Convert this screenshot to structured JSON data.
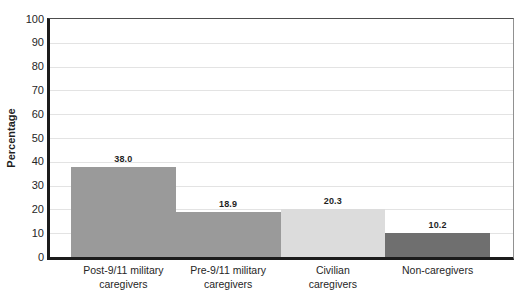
{
  "chart_data": {
    "type": "bar",
    "title": "",
    "xlabel": "",
    "ylabel": "Percentage",
    "categories": [
      "Post-9/11 military\ncaregivers",
      "Pre-9/11 military\ncaregivers",
      "Civilian\ncaregivers",
      "Non-caregivers"
    ],
    "values": [
      38.0,
      18.9,
      20.3,
      10.2
    ],
    "value_labels": [
      "38.0",
      "18.9",
      "20.3",
      "10.2"
    ],
    "ylim": [
      0,
      100
    ],
    "yticks": [
      0,
      10,
      20,
      30,
      40,
      50,
      60,
      70,
      80,
      90,
      100
    ],
    "grid": true,
    "legend": "none",
    "bar_colors": [
      "#9a9a9a",
      "#9a9a9a",
      "#dcdcdc",
      "#6f6f6f"
    ]
  },
  "colors": {
    "background": "#ffffff",
    "axis": "#1c1c1c",
    "gridline": "#e3e3e3",
    "plot_border_top": "#4d4d4d",
    "plot_border_right": "#919191",
    "text": "#2b2b2b"
  }
}
